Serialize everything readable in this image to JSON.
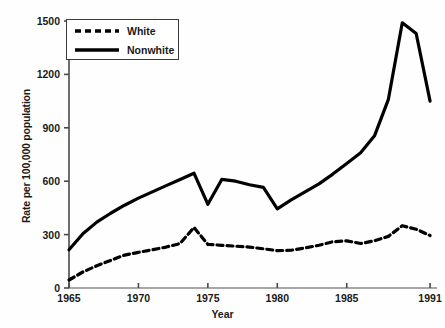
{
  "chart_data": {
    "type": "line",
    "title": "",
    "xlabel": "Year",
    "ylabel": "Rate per 100,000 population",
    "xlim": [
      1965,
      1991.5
    ],
    "ylim": [
      0,
      1500
    ],
    "yticks": [
      0,
      300,
      600,
      900,
      1200,
      1500
    ],
    "ytick_labels": [
      "0",
      "300",
      "600",
      "900",
      "1200",
      "1500"
    ],
    "xticks": [
      1965,
      1970,
      1975,
      1980,
      1985,
      1991
    ],
    "xtick_labels": [
      "1965",
      "1970",
      "1975",
      "1980",
      "1985",
      "1991"
    ],
    "grid": false,
    "legend_position": "upper left",
    "x": [
      1965,
      1966,
      1967,
      1968,
      1969,
      1970,
      1971,
      1972,
      1973,
      1974,
      1975,
      1976,
      1977,
      1978,
      1979,
      1980,
      1981,
      1982,
      1983,
      1984,
      1985,
      1986,
      1987,
      1988,
      1989,
      1990,
      1991
    ],
    "series": [
      {
        "name": "White",
        "style": "dashed",
        "color": "#000000",
        "values": [
          45,
          90,
          125,
          155,
          185,
          200,
          215,
          230,
          250,
          340,
          245,
          240,
          235,
          230,
          220,
          210,
          212,
          225,
          240,
          260,
          265,
          250,
          265,
          290,
          350,
          330,
          295
        ]
      },
      {
        "name": "Nonwhite",
        "style": "solid",
        "color": "#000000",
        "values": [
          215,
          305,
          370,
          420,
          465,
          505,
          540,
          575,
          610,
          645,
          470,
          610,
          600,
          580,
          565,
          445,
          495,
          540,
          585,
          640,
          700,
          760,
          855,
          1060,
          1490,
          1430,
          1050
        ]
      }
    ]
  },
  "legend": {
    "entries": [
      {
        "label": "White",
        "style": "dashed"
      },
      {
        "label": "Nonwhite",
        "style": "solid"
      }
    ]
  }
}
